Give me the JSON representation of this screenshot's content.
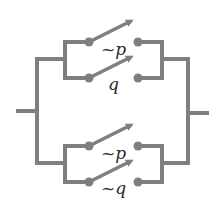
{
  "diagram": {
    "type": "switching-circuit",
    "colors": {
      "wire": "#7f7f7f",
      "label": "#2a2a2a",
      "background": "#ffffff"
    },
    "branches": [
      {
        "name": "upper-parallel-block",
        "switches": [
          {
            "label": "~p",
            "state": "open"
          },
          {
            "label": "q",
            "state": "open"
          }
        ]
      },
      {
        "name": "lower-parallel-block",
        "switches": [
          {
            "label": "~p",
            "state": "open"
          },
          {
            "label": "~q",
            "state": "open"
          }
        ]
      }
    ]
  }
}
